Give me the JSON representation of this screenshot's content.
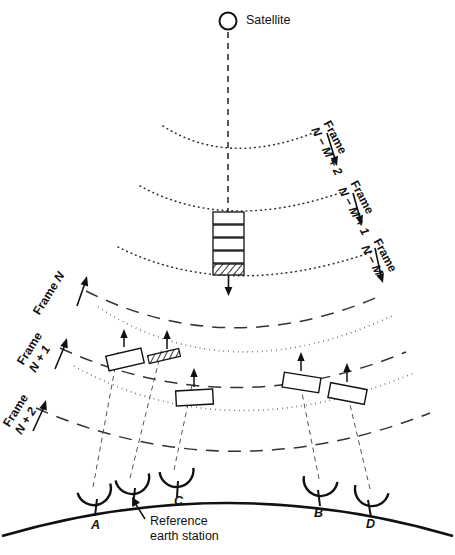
{
  "figure": {
    "type": "satellite-tdma-frame-diagram",
    "satellite": {
      "label": "Satellite",
      "icon": "circle-outline-icon"
    },
    "downlink_frames": [
      {
        "id": "frame-n-m-plus-2",
        "prefix": "Frame",
        "expr": "N − M + 2",
        "direction": "down",
        "arc_style": "dotted"
      },
      {
        "id": "frame-n-m-plus-1",
        "prefix": "Frame",
        "expr": "N − M + 1",
        "direction": "down",
        "arc_style": "dotted"
      },
      {
        "id": "frame-n-m",
        "prefix": "Frame",
        "expr": "N − M",
        "direction": "down",
        "arc_style": "dotted"
      }
    ],
    "uplink_frames": [
      {
        "id": "frame-n",
        "prefix": "Frame",
        "expr": "N",
        "direction": "up",
        "arc_style": "dashed"
      },
      {
        "id": "frame-n-plus-1",
        "prefix": "Frame",
        "expr": "N + 1",
        "direction": "up",
        "arc_style": "dashed"
      },
      {
        "id": "frame-n-plus-2",
        "prefix": "Frame",
        "expr": "N + 2",
        "direction": "up",
        "arc_style": "dashed"
      }
    ],
    "satellite_burst_stack": {
      "count": 5,
      "bursts": [
        {
          "fill": "empty"
        },
        {
          "fill": "empty"
        },
        {
          "fill": "empty"
        },
        {
          "fill": "empty"
        },
        {
          "fill": "hatched"
        }
      ]
    },
    "uplink_bursts": [
      {
        "id": "burst-a",
        "fill": "empty",
        "station": "A"
      },
      {
        "id": "burst-reference",
        "fill": "hatched",
        "station": "Reference"
      },
      {
        "id": "burst-c",
        "fill": "empty",
        "station": "C"
      },
      {
        "id": "burst-b",
        "fill": "empty",
        "station": "B"
      },
      {
        "id": "burst-d",
        "fill": "empty",
        "station": "D"
      }
    ],
    "earth_stations": [
      {
        "id": "station-a",
        "label": "A",
        "has_label": true
      },
      {
        "id": "station-reference",
        "label": "",
        "has_label": false
      },
      {
        "id": "station-c",
        "label": "C",
        "has_label": true
      },
      {
        "id": "station-b",
        "label": "B",
        "has_label": true
      },
      {
        "id": "station-d",
        "label": "D",
        "has_label": true
      }
    ],
    "annotations": {
      "reference_note_line1": "Reference",
      "reference_note_line2": "earth station"
    },
    "colors": {
      "ink": "#111111",
      "background": "#ffffff",
      "thin_line": "#444444"
    }
  }
}
